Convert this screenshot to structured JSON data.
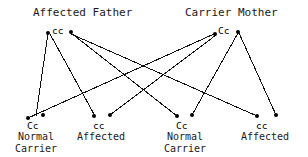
{
  "diagram": {
    "type": "punnett-cross-pedigree",
    "trait_mode": "autosomal recessive",
    "stroke_color": "#111111",
    "node_color": "#000000"
  },
  "parents": [
    {
      "id": "father",
      "title": "Affected Father",
      "genotype": "cc",
      "status": "Affected",
      "title_x": 33,
      "title_y": 6,
      "genotype_x": 52,
      "genotype_y": 25,
      "dots": [
        {
          "name": "father-allele-left",
          "x": 48,
          "y": 33
        },
        {
          "name": "father-allele-right",
          "x": 71,
          "y": 32
        }
      ]
    },
    {
      "id": "mother",
      "title": "Carrier Mother",
      "genotype": "Cc",
      "status": "Carrier",
      "title_x": 185,
      "title_y": 6,
      "genotype_x": 218,
      "genotype_y": 25,
      "dots": [
        {
          "name": "mother-allele-left",
          "x": 215,
          "y": 34
        },
        {
          "name": "mother-allele-right",
          "x": 238,
          "y": 32
        }
      ]
    }
  ],
  "children": [
    {
      "id": "child-1",
      "genotype": "Cc",
      "label_line1": "Normal",
      "label_line2": "Carrier",
      "genotype_x": 27,
      "genotype_y": 120,
      "label_x": 8,
      "label_y": 131,
      "label_w": 56,
      "dots": [
        {
          "name": "child-1-allele-left",
          "x": 28,
          "y": 118
        },
        {
          "name": "child-1-allele-right",
          "x": 43,
          "y": 115
        }
      ]
    },
    {
      "id": "child-2",
      "genotype": "cc",
      "label_line1": "Affected",
      "label_line2": "",
      "genotype_x": 93,
      "genotype_y": 120,
      "label_x": 73,
      "label_y": 131,
      "label_w": 56,
      "dots": [
        {
          "name": "child-2-allele-left",
          "x": 94,
          "y": 116
        },
        {
          "name": "child-2-allele-right",
          "x": 110,
          "y": 115
        }
      ]
    },
    {
      "id": "child-3",
      "genotype": "Cc",
      "label_line1": "Normal",
      "label_line2": "Carrier",
      "genotype_x": 176,
      "genotype_y": 120,
      "label_x": 157,
      "label_y": 131,
      "label_w": 56,
      "dots": [
        {
          "name": "child-3-allele-left",
          "x": 177,
          "y": 116
        },
        {
          "name": "child-3-allele-right",
          "x": 192,
          "y": 115
        }
      ]
    },
    {
      "id": "child-4",
      "genotype": "cc",
      "label_line1": "Affected",
      "label_line2": "",
      "genotype_x": 256,
      "genotype_y": 120,
      "label_x": 237,
      "label_y": 131,
      "label_w": 56,
      "dots": [
        {
          "name": "child-4-allele-left",
          "x": 257,
          "y": 116
        },
        {
          "name": "child-4-allele-right",
          "x": 276,
          "y": 115
        }
      ]
    }
  ],
  "allele_lines": [
    {
      "name": "father-to-child-1",
      "from": "father",
      "to": "child-1",
      "x1": 48,
      "y1": 33,
      "x2": 36,
      "y2": 116
    },
    {
      "name": "father-to-child-2",
      "from": "father",
      "to": "child-2",
      "x1": 50,
      "y1": 34,
      "x2": 95,
      "y2": 116
    },
    {
      "name": "father-to-child-3",
      "from": "father",
      "to": "child-3",
      "x1": 71,
      "y1": 33,
      "x2": 177,
      "y2": 116
    },
    {
      "name": "father-to-child-4",
      "from": "father",
      "to": "child-4",
      "x1": 71,
      "y1": 34,
      "x2": 257,
      "y2": 116
    },
    {
      "name": "mother-to-child-1",
      "from": "mother",
      "to": "child-1",
      "x1": 214,
      "y1": 34,
      "x2": 28,
      "y2": 118
    },
    {
      "name": "mother-to-child-2",
      "from": "mother",
      "to": "child-2",
      "x1": 216,
      "y1": 35,
      "x2": 110,
      "y2": 115
    },
    {
      "name": "mother-to-child-3",
      "from": "mother",
      "to": "child-3",
      "x1": 238,
      "y1": 33,
      "x2": 192,
      "y2": 115
    },
    {
      "name": "mother-to-child-4",
      "from": "mother",
      "to": "child-4",
      "x1": 239,
      "y1": 33,
      "x2": 276,
      "y2": 115
    }
  ]
}
